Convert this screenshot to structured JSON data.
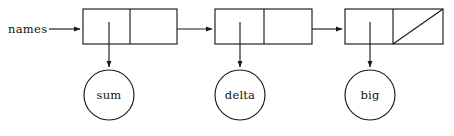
{
  "diagram": {
    "type": "linked-list",
    "title": "names",
    "canvas": {
      "width": 454,
      "height": 136,
      "background": "#ffffff"
    },
    "stroke_color": "#1a1a1a",
    "text_color": "#111111",
    "head_label": "names",
    "cells": [
      {
        "id": "cell-1",
        "x": 83,
        "y": 9,
        "width": 94,
        "height": 35,
        "divider_x": 130,
        "data_label": "sum",
        "next_is_null": false
      },
      {
        "id": "cell-2",
        "x": 215,
        "y": 9,
        "width": 97,
        "height": 35,
        "divider_x": 264,
        "data_label": "delta",
        "next_is_null": false
      },
      {
        "id": "cell-3",
        "x": 345,
        "y": 9,
        "width": 98,
        "height": 35,
        "divider_x": 393,
        "data_label": "big",
        "next_is_null": true
      }
    ],
    "nodes": [
      {
        "id": "node-sum",
        "label": "sum",
        "cx": 109,
        "cy": 95,
        "r": 25
      },
      {
        "id": "node-delta",
        "label": "delta",
        "cx": 240,
        "cy": 95,
        "r": 25
      },
      {
        "id": "node-big",
        "label": "big",
        "cx": 370,
        "cy": 95,
        "r": 25
      }
    ],
    "links": [
      {
        "id": "link-head",
        "from": "names",
        "to": "cell-1",
        "x1": 49,
        "y1": 29,
        "x2": 83,
        "y2": 29
      },
      {
        "id": "link-1-to-2",
        "from": "cell-1",
        "to": "cell-2",
        "x1": 177,
        "y1": 29,
        "x2": 215,
        "y2": 29
      },
      {
        "id": "link-2-to-3",
        "from": "cell-2",
        "to": "cell-3",
        "x1": 312,
        "y1": 29,
        "x2": 345,
        "y2": 29
      }
    ],
    "pointers": [
      {
        "id": "ptr-sum",
        "from": "cell-1",
        "to": "node-sum",
        "x": 109,
        "y1": 22,
        "y2": 70
      },
      {
        "id": "ptr-delta",
        "from": "cell-2",
        "to": "node-delta",
        "x": 240,
        "y1": 22,
        "y2": 70
      },
      {
        "id": "ptr-big",
        "from": "cell-3",
        "to": "node-big",
        "x": 370,
        "y1": 22,
        "y2": 70
      }
    ],
    "null_marker": {
      "cell": "cell-3",
      "description": "diagonal-slash",
      "x1": 393,
      "y1": 44,
      "x2": 443,
      "y2": 9
    }
  }
}
